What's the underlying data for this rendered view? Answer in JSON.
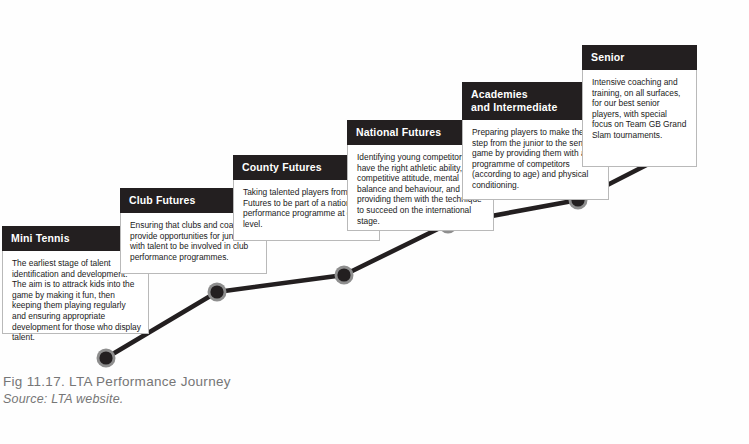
{
  "figure": {
    "caption_title": "Fig 11.17. LTA Performance Journey",
    "caption_source": "Source: LTA website."
  },
  "colors": {
    "header_fill": "#231f20",
    "header_text": "#ffffff",
    "body_fill": "#ffffff",
    "body_border": "#b9b9b9",
    "line": "#231f20",
    "marker_core": "#231f20",
    "marker_halo": "#8e8e8e",
    "caption_text": "#767676",
    "background": "#fefefe"
  },
  "chart_data": {
    "type": "line",
    "title": "LTA Performance Journey",
    "xlabel": "",
    "ylabel": "",
    "grid": false,
    "legend": "none",
    "categories": [
      "Mini Tennis",
      "Club Futures",
      "County Futures",
      "National Futures",
      "Academies and Intermediate",
      "Senior"
    ],
    "series": [
      {
        "name": "Performance Journey",
        "values": [
          1,
          2,
          3,
          4,
          5,
          6
        ]
      }
    ],
    "points": [
      {
        "label": "Mini Tennis",
        "x": 106,
        "y": 358
      },
      {
        "label": "Club Futures",
        "x": 217,
        "y": 292
      },
      {
        "label": "County Futures",
        "x": 344,
        "y": 275
      },
      {
        "label": "National Futures",
        "x": 448,
        "y": 224
      },
      {
        "label": "Academies and Intermediate",
        "x": 578,
        "y": 200
      },
      {
        "label": "Senior",
        "x": 672,
        "y": 152
      }
    ]
  },
  "stages": [
    {
      "title": "Mini Tennis",
      "body": "The earliest stage of talent identification and development. The aim is to attrack kids into the game by making it fun, then keeping them playing regularly and ensuring appropriate development for those who display talent."
    },
    {
      "title": "Club Futures",
      "body": "Ensuring that clubs and coaches provide opportunities for juniors with talent to be involved in club performance programmes."
    },
    {
      "title": "County Futures",
      "body": "Taking talented players from Club Futures to be part of a nationwide performance programme at county level."
    },
    {
      "title": "National Futures",
      "body": "Identifying young competitors who have the right athletic ability, competitive attitude, mental balance and behaviour, and providing them with the technique to succeed on the international stage."
    },
    {
      "title": "Academies\nand Intermediate",
      "title_line1": "Academies",
      "title_line2": "and Intermediate",
      "body": "Preparing players to make the step from the junior to the senior game by providing them with a programme of competitors (according to age) and physical conditioning."
    },
    {
      "title": "Senior",
      "body": "Intensive coaching and training, on all surfaces, for our best senior players, with special focus on Team GB Grand Slam tournaments."
    }
  ]
}
